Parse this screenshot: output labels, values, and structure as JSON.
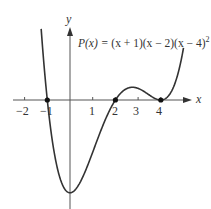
{
  "chart_data": {
    "type": "line",
    "xlabel": "x",
    "ylabel": "y",
    "x_ticks": [
      -2,
      -1,
      1,
      2,
      3,
      4
    ],
    "x_tick_labels": [
      "−2",
      "−1",
      "1",
      "2",
      "3",
      "4"
    ],
    "xlim": [
      -2.5,
      5.3
    ],
    "ylim": [
      -38,
      25
    ],
    "grid": false,
    "series": [
      {
        "name": "P(x)",
        "function": "(x+1)(x-2)(x-4)^2",
        "x_range": [
          -1.27,
          5.0
        ],
        "roots": [
          -1,
          2,
          4
        ],
        "marked_points": [
          [
            -1,
            0
          ],
          [
            2,
            0
          ],
          [
            4,
            0
          ]
        ]
      }
    ]
  },
  "labels": {
    "y_axis": "y",
    "x_axis": "x",
    "formula_lhs": "P(x) = ",
    "formula_body": "(x + 1)(x − 2)(x − 4)",
    "formula_exp": "2",
    "ticks": [
      "−2",
      "−1",
      "1",
      "2",
      "3",
      "4"
    ]
  }
}
